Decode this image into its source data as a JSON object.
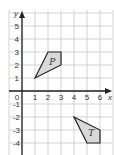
{
  "diagram": {
    "axes": {
      "x_label": "x",
      "y_label": "y",
      "x_ticks": [
        "1",
        "2",
        "3",
        "4",
        "5",
        "6"
      ],
      "y_ticks_pos": [
        "1",
        "2",
        "3",
        "4",
        "5"
      ],
      "y_ticks_neg": [
        "-1",
        "-2",
        "-3",
        "-4"
      ],
      "origin_label": "0"
    },
    "shapes": [
      {
        "label": "P",
        "vertices": [
          [
            1,
            1
          ],
          [
            2,
            3
          ],
          [
            3,
            3
          ],
          [
            3,
            2
          ]
        ]
      },
      {
        "label": "T",
        "vertices": [
          [
            4,
            -2
          ],
          [
            6,
            -3
          ],
          [
            6,
            -4
          ],
          [
            5,
            -4
          ]
        ]
      }
    ],
    "colors": {
      "fill": "#d9d9d9",
      "grid": "#c8c8c8",
      "axis": "#222222"
    }
  }
}
